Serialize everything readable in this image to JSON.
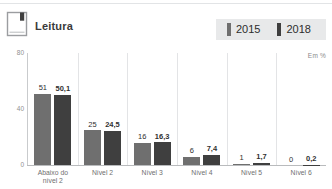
{
  "header": {
    "title": "Leitura",
    "icon": "book-icon"
  },
  "legend": {
    "items": [
      {
        "label": "2015",
        "color": "#6f6f6f"
      },
      {
        "label": "2018",
        "color": "#3f3f3f"
      }
    ]
  },
  "unit_note": "Em %",
  "chart_data": {
    "type": "bar",
    "title": "Leitura",
    "xlabel": "",
    "ylabel": "",
    "unit": "Em %",
    "ylim": [
      0,
      80
    ],
    "yticks": [
      "0",
      "40",
      "80"
    ],
    "grid": false,
    "legend_position": "top-right",
    "categories": [
      "Abaixo do nível 2",
      "Nível 2",
      "Nível 3",
      "Nível 4",
      "Nível 5",
      "Nível 6"
    ],
    "category_lines": [
      [
        "Abaixo do",
        "nível 2"
      ],
      [
        "Nível 2",
        ""
      ],
      [
        "Nível 3",
        ""
      ],
      [
        "Nível 4",
        ""
      ],
      [
        "Nível 5",
        ""
      ],
      [
        "Nível 6",
        ""
      ]
    ],
    "series": [
      {
        "name": "2015",
        "color": "#6f6f6f",
        "values": [
          51,
          25,
          16,
          6,
          1,
          0
        ],
        "labels": [
          "51",
          "25",
          "16",
          "6",
          "1",
          "0"
        ]
      },
      {
        "name": "2018",
        "color": "#3f3f3f",
        "values": [
          50.1,
          24.5,
          16.3,
          7.4,
          1.7,
          0.2
        ],
        "labels": [
          "50,1",
          "24,5",
          "16,3",
          "7,4",
          "1,7",
          "0,2"
        ]
      }
    ]
  }
}
